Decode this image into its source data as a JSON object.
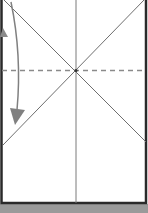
{
  "diagram": {
    "type": "origami-fold-step",
    "colors": {
      "paper": "#ffffff",
      "border": "#2a2a2a",
      "crease": "#7a7a7a",
      "dashed_fold": "#8a8a8a",
      "arrow": "#808080",
      "table_band": "#9a9a9a"
    },
    "elements": [
      {
        "name": "paper-rectangle",
        "description": "Rectangular sheet outlined with dark border"
      },
      {
        "name": "vertical-center-crease",
        "description": "Vertical crease line through the middle"
      },
      {
        "name": "diagonal-crease-left",
        "description": "Diagonal crease from top-left to lower-right"
      },
      {
        "name": "diagonal-crease-right",
        "description": "Diagonal crease from top-right to lower-left"
      },
      {
        "name": "dashed-fold-line",
        "description": "Horizontal dashed valley fold line through crease intersection"
      },
      {
        "name": "curved-fold-arrow",
        "description": "Curved arrow indicating folding down on the left side"
      },
      {
        "name": "partial-arrowhead",
        "description": "Gray triangle marker at left edge"
      }
    ]
  }
}
